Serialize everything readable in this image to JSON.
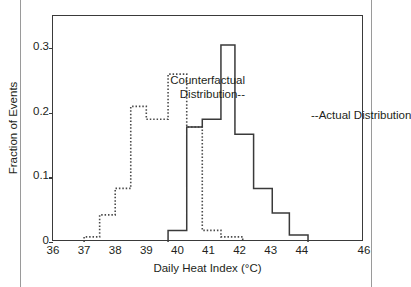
{
  "figure": {
    "background": "#ffffff",
    "frame_color": "#3a3a3a",
    "text_color": "#231f20"
  },
  "annotations": {
    "counterfactual_line1": "Counterfactual",
    "counterfactual_line2": "Distribution",
    "actual": "Actual Distribution"
  },
  "chart_data": {
    "type": "bar",
    "subtype": "step-histogram",
    "title": "",
    "xlabel": "Daily Heat Index (°C)",
    "ylabel": "Fraction of Events",
    "xlim": [
      36,
      46
    ],
    "ylim": [
      0,
      0.35
    ],
    "xticks": [
      36,
      37,
      38,
      39,
      40,
      41,
      42,
      43,
      44,
      46
    ],
    "xticklabels": [
      "36",
      "37",
      "38",
      "39",
      "40",
      "41",
      "42",
      "43",
      "44",
      "46"
    ],
    "yticks": [
      0,
      0.1,
      0.2,
      0.3
    ],
    "yticklabels": [
      "0",
      "0.1",
      "0.2",
      "0.3"
    ],
    "grid": false,
    "legend": "inline-annotations",
    "bin_width": 0.5,
    "series": [
      {
        "name": "Counterfactual Distribution",
        "style": "dotted",
        "color": "#4a4a4a",
        "bin_edges": [
          37.0,
          37.5,
          38.0,
          38.5,
          39.0,
          39.5,
          40.0,
          40.25,
          40.75,
          41.25,
          41.75,
          42.25
        ],
        "bins": [
          {
            "x0": 37.0,
            "x1": 37.5,
            "value": 0.008
          },
          {
            "x0": 37.5,
            "x1": 38.0,
            "value": 0.042
          },
          {
            "x0": 38.0,
            "x1": 38.5,
            "value": 0.083
          },
          {
            "x0": 38.5,
            "x1": 39.0,
            "value": 0.21
          },
          {
            "x0": 39.0,
            "x1": 39.7,
            "value": 0.19
          },
          {
            "x0": 39.7,
            "x1": 40.3,
            "value": 0.26
          },
          {
            "x0": 40.3,
            "x1": 40.8,
            "value": 0.178
          },
          {
            "x0": 40.8,
            "x1": 41.4,
            "value": 0.018
          },
          {
            "x0": 41.4,
            "x1": 42.1,
            "value": 0.008
          }
        ]
      },
      {
        "name": "Actual Distribution",
        "style": "solid",
        "color": "#3a3a3a",
        "bins": [
          {
            "x0": 39.7,
            "x1": 40.3,
            "value": 0.018
          },
          {
            "x0": 40.3,
            "x1": 40.8,
            "value": 0.178
          },
          {
            "x0": 40.8,
            "x1": 41.4,
            "value": 0.19
          },
          {
            "x0": 41.4,
            "x1": 41.85,
            "value": 0.305
          },
          {
            "x0": 41.85,
            "x1": 42.45,
            "value": 0.167
          },
          {
            "x0": 42.45,
            "x1": 43.05,
            "value": 0.083
          },
          {
            "x0": 43.05,
            "x1": 43.6,
            "value": 0.045
          },
          {
            "x0": 43.6,
            "x1": 44.2,
            "value": 0.011
          }
        ]
      }
    ]
  }
}
